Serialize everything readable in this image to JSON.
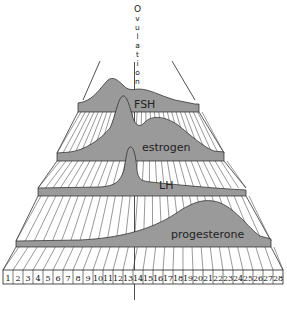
{
  "diagram": {
    "title_vertical": "Ovulation",
    "ovulation_letters": [
      "O",
      "v",
      "u",
      "l",
      "a",
      "t",
      "i",
      "o",
      "n"
    ],
    "hormones": [
      {
        "name": "FSH"
      },
      {
        "name": "estrogen"
      },
      {
        "name": "LH"
      },
      {
        "name": "progesterone"
      }
    ],
    "days": [
      "1",
      "2",
      "3",
      "4",
      "5",
      "6",
      "7",
      "8",
      "9",
      "10",
      "11",
      "12",
      "13",
      "14",
      "15",
      "16",
      "17",
      "18",
      "19",
      "20",
      "21",
      "22",
      "23",
      "24",
      "25",
      "26",
      "27",
      "28"
    ],
    "fill_color": "#9a9a9a",
    "line_color": "#222222"
  }
}
